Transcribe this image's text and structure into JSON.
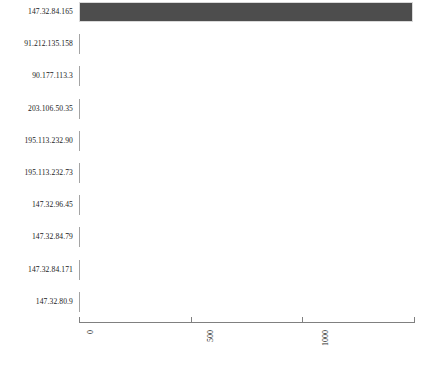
{
  "chart_data": {
    "type": "bar",
    "orientation": "horizontal",
    "title": "",
    "xlabel": "",
    "ylabel": "",
    "xlim": [
      0,
      1500
    ],
    "grid": false,
    "legend": null,
    "bar_color": "#4d4d4d",
    "categories": [
      "147.32.84.165",
      "91.212.135.158",
      "90.177.113.3",
      "203.106.50.35",
      "195.113.232.90",
      "195.113.232.73",
      "147.32.96.45",
      "147.32.84.79",
      "147.32.84.171",
      "147.32.80.9"
    ],
    "values": [
      1495,
      5,
      5,
      5,
      5,
      5,
      5,
      5,
      5,
      5
    ],
    "xticks": [
      0,
      500,
      1000,
      1500
    ],
    "xticklabels": [
      "0",
      "500",
      "1000",
      "1500"
    ]
  },
  "axis": {
    "line_color": "#808080",
    "tick_rotation": "90"
  }
}
